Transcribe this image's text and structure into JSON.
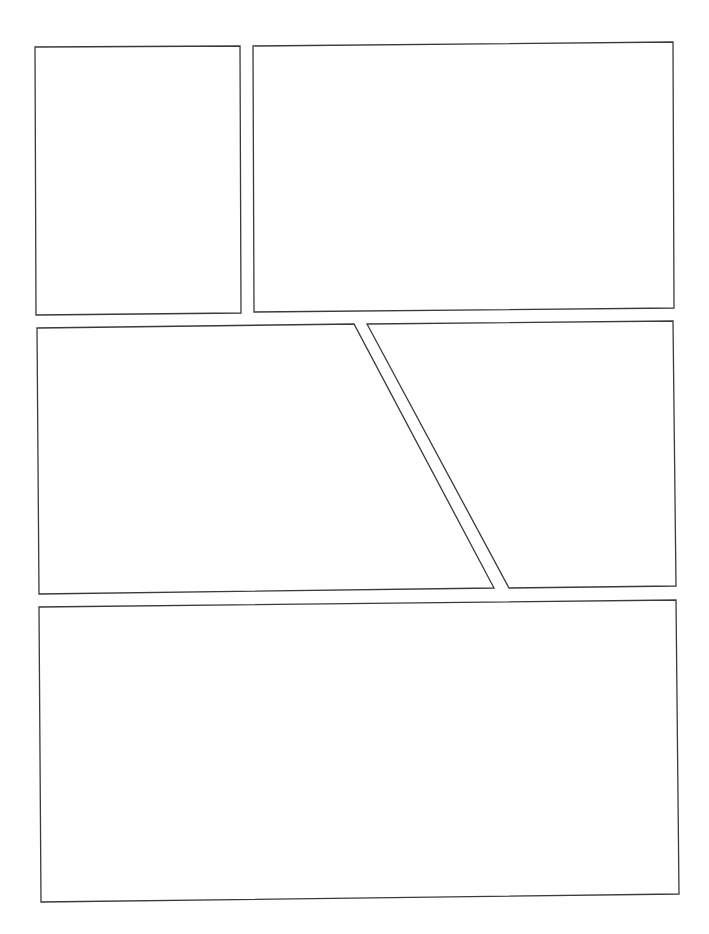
{
  "page": {
    "type": "comic-page-template",
    "width": 709,
    "height": 934,
    "background": "#ffffff",
    "border_color": "#3a3a3a"
  },
  "panels": [
    {
      "id": "panel-1",
      "row": 1,
      "points": "35,47 240,46 241,313 36,315"
    },
    {
      "id": "panel-2",
      "row": 1,
      "points": "253,46 673,42 674,308 254,312"
    },
    {
      "id": "panel-3",
      "row": 2,
      "points": "37,328 354,324 494,588 39,594"
    },
    {
      "id": "panel-4",
      "row": 2,
      "points": "367,324 673,321 676,586 509,588"
    },
    {
      "id": "panel-5",
      "row": 3,
      "points": "39,607 676,600 679,894 41,902"
    }
  ]
}
